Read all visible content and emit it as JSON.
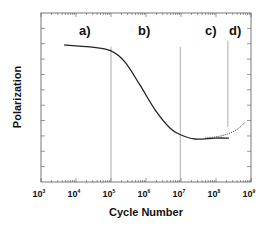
{
  "chart_data": {
    "type": "line",
    "title": "",
    "xlabel": "Cycle Number",
    "ylabel": "Polarization",
    "xscale": "log",
    "xlim_log10": [
      3,
      9
    ],
    "ylim": [
      0,
      11
    ],
    "x_tick_labels": [
      {
        "base": "10",
        "exp": "3",
        "log10": 3
      },
      {
        "base": "10",
        "exp": "4",
        "log10": 4
      },
      {
        "base": "10",
        "exp": "5",
        "log10": 5
      },
      {
        "base": "10",
        "exp": "6",
        "log10": 6
      },
      {
        "base": "10",
        "exp": "7",
        "log10": 7
      },
      {
        "base": "10",
        "exp": "8",
        "log10": 8
      },
      {
        "base": "10",
        "exp": "9",
        "log10": 9
      }
    ],
    "y_ticks": [
      1,
      2,
      3,
      4,
      5,
      6,
      7,
      8,
      9,
      10
    ],
    "y_tick_labels_shown": false,
    "grid": false,
    "legend": null,
    "series": [
      {
        "name": "polarization (solid)",
        "style": "solid",
        "x_log10": [
          3.66,
          4.4,
          5.0,
          5.4,
          5.83,
          6.26,
          6.69,
          7.0,
          7.4,
          7.97,
          8.37
        ],
        "values": [
          8.92,
          8.79,
          8.53,
          7.8,
          6.3,
          4.7,
          3.5,
          3.06,
          2.8,
          2.86,
          2.86
        ]
      },
      {
        "name": "polarization (dotted recovery)",
        "style": "dotted",
        "x_log10": [
          7.69,
          8.1,
          8.4,
          8.65,
          8.83
        ],
        "values": [
          2.86,
          2.98,
          3.19,
          3.5,
          3.9
        ]
      }
    ],
    "region_dividers_log10": [
      {
        "x_log10": 5.0,
        "y_from": 0,
        "y_to": 8.8
      },
      {
        "x_log10": 6.98,
        "y_from": 0,
        "y_to": 8.8
      },
      {
        "x_log10": 8.34,
        "y_from": 3.6,
        "y_to": 9.2
      }
    ],
    "annotations": [
      {
        "text": "a)",
        "x_log10": 4.25,
        "y": 9.55
      },
      {
        "text": "b)",
        "x_log10": 5.95,
        "y": 9.55
      },
      {
        "text": "c)",
        "x_log10": 7.85,
        "y": 9.55
      },
      {
        "text": "d)",
        "x_log10": 8.55,
        "y": 9.55
      }
    ]
  }
}
